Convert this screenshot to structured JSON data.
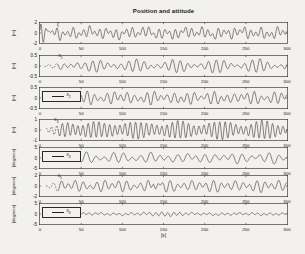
{
  "figure": {
    "title": "Position and attitude",
    "xlabel": "[s]",
    "background": "#f2f1ee",
    "ink": "#222222",
    "xtick_labels": [
      "0",
      "50",
      "100",
      "150",
      "200",
      "250",
      "300"
    ]
  },
  "chart_data": [
    {
      "type": "line",
      "ylabel": "[m]",
      "ylim": [
        -2,
        2
      ],
      "yticks": [
        "2",
        "0",
        "-2"
      ],
      "xlim": [
        0,
        300
      ],
      "xticks": [
        0,
        50,
        100,
        150,
        200,
        250,
        300
      ],
      "legend": null,
      "annotation": {
        "base": "ξ",
        "sub": "",
        "t": 22,
        "y": 1.2
      },
      "series": {
        "components": [
          {
            "n": 46,
            "a": 0.62,
            "p": 0.3
          },
          {
            "n": 29,
            "a": 0.42,
            "p": 2.1
          },
          {
            "n": 13,
            "a": 0.28,
            "p": 4.0
          },
          {
            "n": 5,
            "a": 0.18,
            "p": 1.2
          }
        ],
        "transient": {
          "a": 1.2,
          "tau": 10,
          "n": 60
        },
        "start": 0,
        "dotted_until": 0
      }
    },
    {
      "type": "line",
      "ylabel": "[m]",
      "ylim": [
        -0.5,
        0.5
      ],
      "yticks": [
        "0.5",
        "0",
        "-0.5"
      ],
      "xlim": [
        0,
        300
      ],
      "xticks": [
        0,
        50,
        100,
        150,
        200,
        250,
        300
      ],
      "legend": null,
      "annotation": {
        "base": "x",
        "sub": "1",
        "t": 25,
        "y": 0.27
      },
      "series": {
        "components": [
          {
            "n": 34,
            "a": 0.2,
            "p": 0.0
          },
          {
            "n": 28,
            "a": 0.13,
            "p": 1.5
          },
          {
            "n": 8,
            "a": 0.04,
            "p": 0.7
          }
        ],
        "mod": {
          "base": 0.45,
          "depth": 0.55,
          "period": 95,
          "phase": 2.8
        },
        "ramp": 40,
        "start": 6,
        "dotted_until": 22
      }
    },
    {
      "type": "line",
      "ylabel": "[m]",
      "ylim": [
        -0.5,
        0.5
      ],
      "yticks": [
        "0.5",
        "0",
        "-0.5"
      ],
      "xlim": [
        0,
        300
      ],
      "xticks": [
        0,
        50,
        100,
        150,
        200,
        250,
        300
      ],
      "legend": {
        "base": "x",
        "sub": "2"
      },
      "annotation": null,
      "series": {
        "components": [
          {
            "n": 37,
            "a": 0.22,
            "p": 0.9
          },
          {
            "n": 25,
            "a": 0.12,
            "p": 3.4
          },
          {
            "n": 6,
            "a": 0.05,
            "p": 2.0
          }
        ],
        "mod": {
          "base": 0.5,
          "depth": 0.5,
          "period": 80,
          "phase": 0.4
        },
        "ramp": 35,
        "start": 8,
        "dotted_until": 24
      }
    },
    {
      "type": "line",
      "ylabel": "[m]",
      "ylim": [
        -1,
        1
      ],
      "yticks": [
        "1",
        "0",
        "-1"
      ],
      "xlim": [
        0,
        300
      ],
      "xticks": [
        0,
        50,
        100,
        150,
        200,
        250,
        300
      ],
      "legend": null,
      "annotation": {
        "base": "x",
        "sub": "3",
        "t": 20,
        "y": 0.55
      },
      "series": {
        "components": [
          {
            "n": 47,
            "a": 0.66,
            "p": 0.2
          },
          {
            "n": 41,
            "a": 0.22,
            "p": 2.9
          },
          {
            "n": 9,
            "a": 0.08,
            "p": 1.1
          }
        ],
        "mod": {
          "base": 0.75,
          "depth": 0.25,
          "period": 110,
          "phase": 1.9
        },
        "ramp": 30,
        "start": 8,
        "dotted_until": 22
      }
    },
    {
      "type": "line",
      "ylabel": "[degrees]",
      "ylim": [
        -5,
        5
      ],
      "yticks": [
        "5",
        "0",
        "-5"
      ],
      "xlim": [
        0,
        300
      ],
      "xticks": [
        0,
        50,
        100,
        150,
        200,
        250,
        300
      ],
      "legend": {
        "base": "x",
        "sub": "4"
      },
      "annotation": null,
      "series": {
        "components": [
          {
            "n": 27,
            "a": 1.7,
            "p": 1.1
          },
          {
            "n": 19,
            "a": 0.9,
            "p": 4.2
          },
          {
            "n": 7,
            "a": 0.5,
            "p": 0.3
          }
        ],
        "mod": {
          "base": 0.6,
          "depth": 0.4,
          "period": 90,
          "phase": 1.0
        },
        "ramp": 30,
        "start": 8,
        "dotted_until": 24
      }
    },
    {
      "type": "line",
      "ylabel": "[degrees]",
      "ylim": [
        -2,
        2
      ],
      "yticks": [
        "2",
        "0",
        "-2"
      ],
      "xlim": [
        0,
        300
      ],
      "xticks": [
        0,
        50,
        100,
        150,
        200,
        250,
        300
      ],
      "legend": null,
      "annotation": {
        "base": "x",
        "sub": "5",
        "t": 24,
        "y": 1.2
      },
      "series": {
        "components": [
          {
            "n": 34,
            "a": 0.75,
            "p": 2.2
          },
          {
            "n": 23,
            "a": 0.45,
            "p": 0.6
          },
          {
            "n": 6,
            "a": 0.15,
            "p": 3.1
          }
        ],
        "mod": {
          "base": 0.7,
          "depth": 0.3,
          "period": 120,
          "phase": 0.0
        },
        "spike": {
          "t0": 140,
          "w": 6,
          "a": 1.1,
          "n": 40
        },
        "ramp": 25,
        "start": 8,
        "dotted_until": 22
      }
    },
    {
      "type": "line",
      "ylabel": "[degrees]",
      "ylim": [
        -5,
        5
      ],
      "yticks": [
        "5",
        "0",
        "-5"
      ],
      "xlim": [
        0,
        300
      ],
      "xticks": [
        0,
        50,
        100,
        150,
        200,
        250,
        300
      ],
      "legend": {
        "base": "x",
        "sub": "6"
      },
      "annotation": null,
      "series": {
        "components": [
          {
            "n": 41,
            "a": 0.45,
            "p": 0.5
          },
          {
            "n": 16,
            "a": 0.22,
            "p": 2.4
          },
          {
            "n": 5,
            "a": 0.15,
            "p": 1.0
          }
        ],
        "mod": {
          "base": 0.8,
          "depth": 0.2,
          "period": 100,
          "phase": 0.5
        },
        "spike": {
          "t0": 152,
          "w": 22,
          "a": 0.55,
          "n": 41
        },
        "ramp": 30,
        "start": 8,
        "dotted_until": 24
      }
    }
  ],
  "layout": {
    "subplot_tops": [
      22,
      55,
      87,
      119,
      147,
      175,
      203
    ],
    "plot_left": 39,
    "plot_width": 249,
    "plot_height": 22
  }
}
